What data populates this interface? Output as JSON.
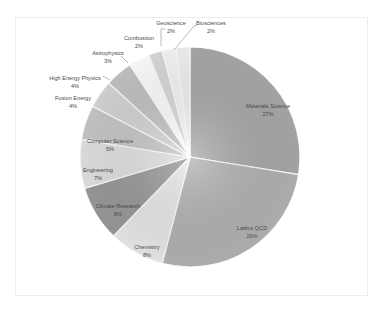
{
  "chart_data": {
    "type": "pie",
    "title": "",
    "start_angle": "12 o'clock",
    "direction": "clockwise",
    "legend": "none (data labels on/near slices)",
    "categories": [
      "Materials Science",
      "Lattice QCD",
      "Chemistry",
      "Climate Research",
      "Engineering",
      "Computer Science",
      "Fusion Energy",
      "High Energy Physics",
      "Astrophysics",
      "Combustion",
      "Geoscience",
      "Biosciences"
    ],
    "values": [
      27,
      26,
      8,
      8,
      7,
      5,
      4,
      4,
      3,
      2,
      2,
      2
    ],
    "labels": [
      "27%",
      "26%",
      "8%",
      "8%",
      "7%",
      "5%",
      "4%",
      "4%",
      "3%",
      "2%",
      "2%",
      "2%"
    ],
    "colors": [
      "#a9a9a9",
      "#b3b3b3",
      "#e9e9e9",
      "#9a9a9a",
      "#e2e2e2",
      "#c8c8c8",
      "#d6d6d6",
      "#c4c4c4",
      "#ffffff",
      "#dadada",
      "#f7f7f7",
      "#f2f2f2"
    ]
  }
}
